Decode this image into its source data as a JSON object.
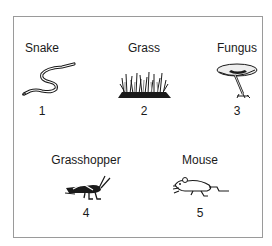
{
  "figure": {
    "organisms": [
      {
        "name": "Snake",
        "number": "1",
        "icon": "snake-icon"
      },
      {
        "name": "Grass",
        "number": "2",
        "icon": "grass-icon"
      },
      {
        "name": "Fungus",
        "number": "3",
        "icon": "mushroom-icon"
      },
      {
        "name": "Grasshopper",
        "number": "4",
        "icon": "grasshopper-icon"
      },
      {
        "name": "Mouse",
        "number": "5",
        "icon": "mouse-icon"
      }
    ],
    "colors": {
      "border": "#9a9a9a",
      "ink": "#1a1a1a",
      "background": "#ffffff"
    }
  }
}
